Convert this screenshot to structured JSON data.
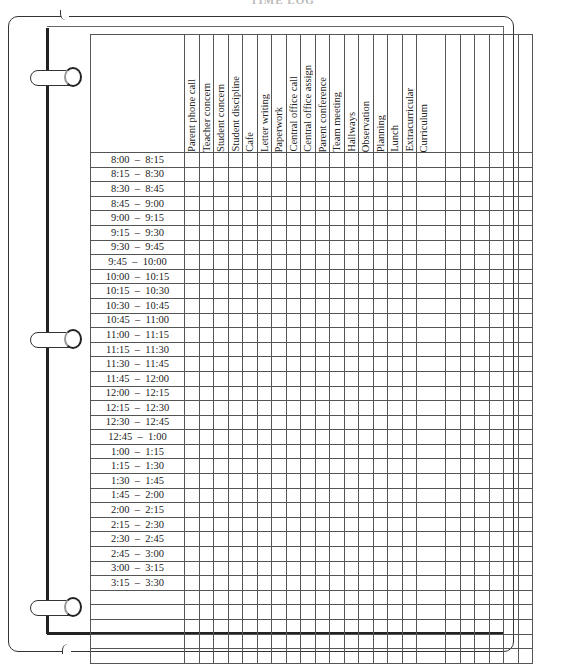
{
  "title": "TIME LOG",
  "columns": [
    {
      "label": "Parent phone call"
    },
    {
      "label": "Teacher concern"
    },
    {
      "label": "Student concern"
    },
    {
      "label": "Student discipline"
    },
    {
      "label": "Cafe"
    },
    {
      "label": "Letter writing"
    },
    {
      "label": "Paperwork"
    },
    {
      "label": "Central office call"
    },
    {
      "label": "Central office assign"
    },
    {
      "label": "Parent conference"
    },
    {
      "label": "Team meeting"
    },
    {
      "label": "Hallways"
    },
    {
      "label": "Observation"
    },
    {
      "label": "Planning"
    },
    {
      "label": "Lunch"
    },
    {
      "label": "Extracurricular"
    },
    {
      "label": "Curriculum"
    },
    {
      "label": ""
    },
    {
      "label": ""
    },
    {
      "label": ""
    },
    {
      "label": ""
    },
    {
      "label": ""
    },
    {
      "label": ""
    }
  ],
  "rows": [
    {
      "time": "8:00  –  8:15"
    },
    {
      "time": "8:15  –  8:30"
    },
    {
      "time": "8:30  –  8:45"
    },
    {
      "time": "8:45  –  9:00"
    },
    {
      "time": "9:00  –  9:15"
    },
    {
      "time": "9:15  –  9:30"
    },
    {
      "time": "9:30  –  9:45"
    },
    {
      "time": "9:45  –  10:00"
    },
    {
      "time": "10:00  –  10:15"
    },
    {
      "time": "10:15  –  10:30"
    },
    {
      "time": "10:30  –  10:45"
    },
    {
      "time": "10:45  –  11:00"
    },
    {
      "time": "11:00  –  11:15"
    },
    {
      "time": "11:15  –  11:30"
    },
    {
      "time": "11:30  –  11:45"
    },
    {
      "time": "11:45  –  12:00"
    },
    {
      "time": "12:00  –  12:15"
    },
    {
      "time": "12:15  –  12:30"
    },
    {
      "time": "12:30  –  12:45"
    },
    {
      "time": "12:45  –  1:00"
    },
    {
      "time": "1:00  –  1:15"
    },
    {
      "time": "1:15  –  1:30"
    },
    {
      "time": "1:30  –  1:45"
    },
    {
      "time": "1:45  –  2:00"
    },
    {
      "time": "2:00  –  2:15"
    },
    {
      "time": "2:15  –  2:30"
    },
    {
      "time": "2:30  –  2:45"
    },
    {
      "time": "2:45  –  3:00"
    },
    {
      "time": "3:00  –  3:15"
    },
    {
      "time": "3:15  –  3:30"
    },
    {
      "time": ""
    },
    {
      "time": ""
    },
    {
      "time": ""
    },
    {
      "time": ""
    },
    {
      "time": ""
    }
  ],
  "rings": [
    {
      "name": "top"
    },
    {
      "name": "middle"
    },
    {
      "name": "bottom"
    }
  ]
}
